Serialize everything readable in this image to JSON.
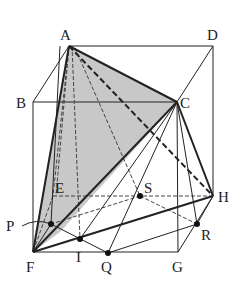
{
  "figure": {
    "type": "cube-geometry-diagram",
    "colors": {
      "line": "#222222",
      "shade": "#c8c8c8",
      "background": "#ffffff"
    },
    "labels": {
      "A": "A",
      "B": "B",
      "C": "C",
      "D": "D",
      "E": "E",
      "F": "F",
      "G": "G",
      "H": "H",
      "P": "P",
      "Q": "Q",
      "R": "R",
      "S": "S",
      "I": "I"
    },
    "points": {
      "A": [
        69,
        46
      ],
      "B": [
        33,
        102
      ],
      "C": [
        177,
        102
      ],
      "D": [
        213,
        46
      ],
      "E": [
        53,
        196
      ],
      "F": [
        33,
        252
      ],
      "G": [
        178,
        252
      ],
      "H": [
        213,
        196
      ],
      "P": [
        51,
        224
      ],
      "I": [
        80,
        239
      ],
      "Q": [
        108,
        253
      ],
      "R": [
        197,
        224
      ],
      "S": [
        140,
        196
      ]
    },
    "shaded_region": [
      "A",
      "F",
      "C"
    ],
    "marked_points": [
      "P",
      "I",
      "Q",
      "R",
      "S"
    ]
  }
}
